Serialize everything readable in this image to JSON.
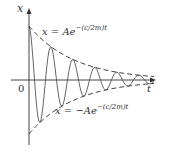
{
  "diagram": {
    "axes": {
      "y_label": "x",
      "x_label": "t",
      "origin_label": "0"
    },
    "upper_envelope": {
      "lhs": "x",
      "eq": "= A",
      "base": "e",
      "exponent": "−(c/2m)t"
    },
    "lower_envelope": {
      "lhs": "x",
      "eq": "= −A",
      "base": "e",
      "exponent": "−(c/2m)t"
    },
    "colors": {
      "curve": "#555555",
      "axis": "#444444",
      "envelope": "#444444"
    },
    "geometry": {
      "origin_x": 29,
      "axis_y": 80,
      "amplitude": 54,
      "decay": 0.022,
      "period": 22,
      "t_end": 125
    }
  }
}
